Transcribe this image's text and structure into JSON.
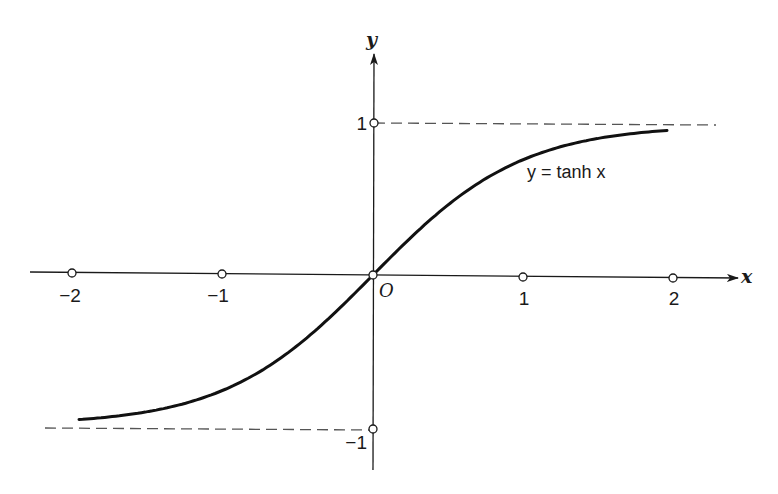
{
  "chart_data": {
    "type": "line",
    "title": "",
    "function": "y = tanh x",
    "curve_label": "y = tanh x",
    "xlabel": "x",
    "ylabel": "y",
    "origin_label": "O",
    "x_ticks": [
      {
        "value": -2,
        "label": "−2"
      },
      {
        "value": -1,
        "label": "−1"
      },
      {
        "value": 1,
        "label": "1"
      },
      {
        "value": 2,
        "label": "2"
      }
    ],
    "y_ticks": [
      {
        "value": 1,
        "label": "1"
      },
      {
        "value": -1,
        "label": "−1"
      }
    ],
    "asymptotes": [
      {
        "y": 1,
        "style": "dashed",
        "x_from": 0,
        "x_to": 2.3
      },
      {
        "y": -1,
        "style": "dashed",
        "x_from": -2.2,
        "x_to": 0
      }
    ],
    "xlim": [
      -2.3,
      2.5
    ],
    "ylim": [
      -1.25,
      1.45
    ],
    "curve_domain": [
      -1.96,
      1.96
    ],
    "series": [
      {
        "name": "tanh x",
        "x": [
          -1.96,
          -1.5,
          -1.0,
          -0.5,
          0,
          0.5,
          1.0,
          1.5,
          1.96
        ],
        "y": [
          -0.961,
          -0.905,
          -0.762,
          -0.462,
          0,
          0.462,
          0.762,
          0.905,
          0.961
        ]
      }
    ],
    "grid": false,
    "legend": "none",
    "colors": {
      "ink": "#1a1a1a",
      "dash": "#555555",
      "background": "#ffffff"
    }
  }
}
